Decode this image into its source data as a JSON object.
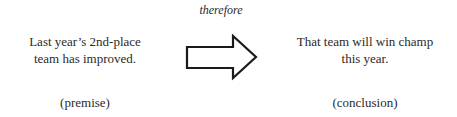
{
  "premise": {
    "text": "Last year’s 2nd-place team has improved.",
    "label": "(premise)"
  },
  "connector": {
    "label": "therefore",
    "icon": "right-arrow-icon"
  },
  "conclusion": {
    "text": "That team will win champ this year.",
    "label": "(conclusion)"
  }
}
